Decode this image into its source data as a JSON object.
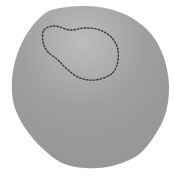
{
  "figure": {
    "type": "blob-with-selection",
    "background": "#ffffff",
    "body": {
      "label": "",
      "fill_light": "#bdbdbd",
      "fill_dark": "#979797",
      "outline_points": [
        [
          44,
          14
        ],
        [
          60,
          8
        ],
        [
          85,
          6
        ],
        [
          110,
          9
        ],
        [
          132,
          18
        ],
        [
          152,
          35
        ],
        [
          164,
          58
        ],
        [
          169,
          85
        ],
        [
          166,
          112
        ],
        [
          155,
          135
        ],
        [
          138,
          155
        ],
        [
          112,
          166
        ],
        [
          85,
          168
        ],
        [
          62,
          163
        ],
        [
          42,
          148
        ],
        [
          25,
          128
        ],
        [
          14,
          105
        ],
        [
          12,
          80
        ],
        [
          17,
          55
        ],
        [
          28,
          32
        ]
      ]
    },
    "selection": {
      "label": "",
      "stroke": "#3a3a3a",
      "dash": "1.5,2",
      "points": [
        [
          44,
          30
        ],
        [
          55,
          26
        ],
        [
          70,
          30
        ],
        [
          85,
          28
        ],
        [
          100,
          30
        ],
        [
          112,
          38
        ],
        [
          118,
          50
        ],
        [
          117,
          65
        ],
        [
          110,
          75
        ],
        [
          95,
          80
        ],
        [
          80,
          78
        ],
        [
          68,
          70
        ],
        [
          58,
          60
        ],
        [
          48,
          52
        ],
        [
          43,
          42
        ]
      ]
    }
  }
}
